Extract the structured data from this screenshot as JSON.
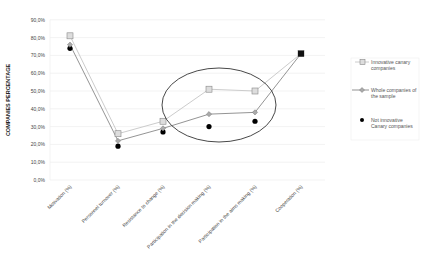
{
  "chart_data": {
    "type": "line",
    "title": "",
    "xlabel": "",
    "ylabel": "COMPANIES PERCENTAGE",
    "ylim": [
      0,
      90
    ],
    "yticks": [
      "0,0%",
      "10,0%",
      "20,0%",
      "30,0%",
      "40,0%",
      "50,0%",
      "60,0%",
      "70,0%",
      "80,0%",
      "90,0%"
    ],
    "grid": true,
    "legend_position": "right",
    "categories": [
      "Motivation (%)",
      "Personnel turnover (%)",
      "Resistance to change (%)",
      "Participation in the decision making (%)",
      "Participation in the aims making (%)",
      "Cooperation (%)"
    ],
    "series": [
      {
        "name": "Innovative canary companies",
        "marker": "square",
        "values": [
          81,
          26,
          33,
          51,
          50,
          71
        ]
      },
      {
        "name": "Whole companies of the sample",
        "marker": "diamond",
        "values": [
          76,
          22,
          29,
          37,
          38,
          71
        ]
      },
      {
        "name": "Not innovative Canary companies",
        "marker": "circle",
        "values": [
          74,
          19,
          27,
          30,
          33,
          71
        ]
      }
    ],
    "annotations": [
      {
        "type": "ellipse",
        "around": [
          "Participation in the decision making (%)",
          "Participation in the aims making (%)"
        ]
      }
    ]
  },
  "legend": {
    "items": [
      {
        "line1": "Innovative canary",
        "line2": "companies"
      },
      {
        "line1": "Whole companies of",
        "line2": "the sample"
      },
      {
        "line1": "Not innovative",
        "line2": "Canary companies"
      }
    ]
  }
}
